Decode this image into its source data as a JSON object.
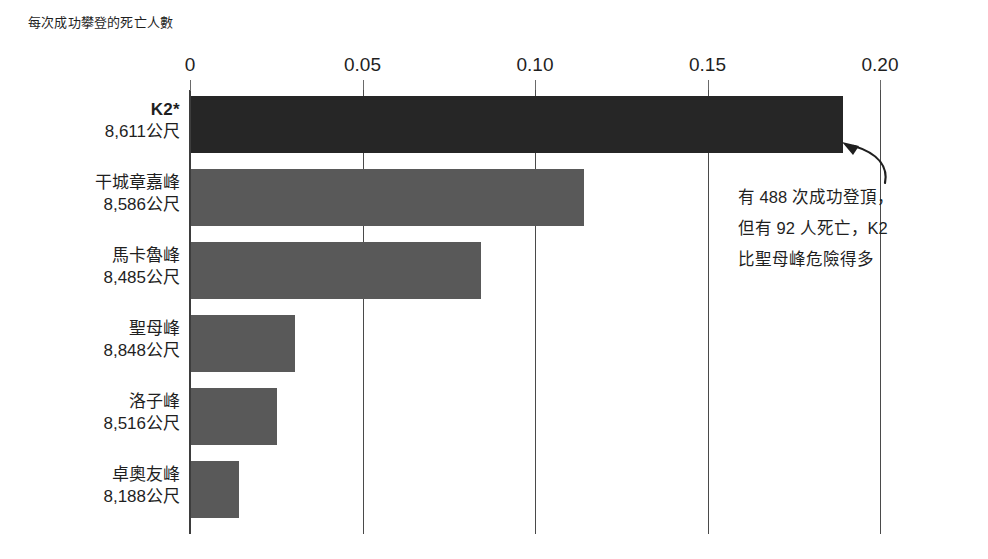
{
  "chart_data": {
    "type": "bar",
    "orientation": "horizontal",
    "title": "每次成功攀登的死亡人數",
    "xlabel": "",
    "ylabel": "",
    "xlim": [
      0,
      0.2
    ],
    "grid": true,
    "legend": false,
    "tick_labels": [
      "0",
      "0.05",
      "0.10",
      "0.15",
      "0.20"
    ],
    "tick_values": [
      0,
      0.05,
      0.1,
      0.15,
      0.2
    ],
    "categories": [
      "K2*",
      "干城章嘉峰",
      "馬卡魯峰",
      "聖母峰",
      "洛子峰",
      "卓奧友峰"
    ],
    "category_sublabels": [
      "8,611公尺",
      "8,586公尺",
      "8,485公尺",
      "8,848公尺",
      "8,516公尺",
      "8,188公尺"
    ],
    "values": [
      0.189,
      0.114,
      0.084,
      0.03,
      0.025,
      0.014
    ],
    "bar_colors": [
      "#262626",
      "#595959",
      "#595959",
      "#595959",
      "#595959",
      "#595959"
    ],
    "highlight_index": 0,
    "annotation": {
      "lines": [
        "有 488 次成功登頂，",
        "但有 92 人死亡，K2",
        "比聖母峰危險得多"
      ]
    }
  },
  "colors": {
    "background": "#ffffff",
    "text": "#1f1f1f",
    "axis": "#3d3d3d",
    "gridline": "#4a4a4a",
    "bar_highlight": "#262626",
    "bar_default": "#595959"
  },
  "rows": [
    {
      "name": "K2*",
      "height": "8,611公尺"
    },
    {
      "name": "干城章嘉峰",
      "height": "8,586公尺"
    },
    {
      "name": "馬卡魯峰",
      "height": "8,485公尺"
    },
    {
      "name": "聖母峰",
      "height": "8,848公尺"
    },
    {
      "name": "洛子峰",
      "height": "8,516公尺"
    },
    {
      "name": "卓奧友峰",
      "height": "8,188公尺"
    }
  ],
  "ticks": [
    {
      "label": "0"
    },
    {
      "label": "0.05"
    },
    {
      "label": "0.10"
    },
    {
      "label": "0.15"
    },
    {
      "label": "0.20"
    }
  ],
  "annotation_lines": [
    {
      "text": "有 488 次成功登頂，"
    },
    {
      "text": "但有 92 人死亡，K2"
    },
    {
      "text": "比聖母峰危險得多"
    }
  ]
}
